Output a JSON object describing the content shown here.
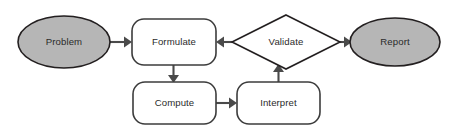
{
  "diagram": {
    "type": "flowchart",
    "background_color": "#ffffff",
    "title": "",
    "nodes": [
      {
        "id": "problem",
        "label": "Problem",
        "shape": "ellipse",
        "fill_color": "#b6b6b6",
        "stroke_color": "#231f20",
        "cx": 64,
        "cy": 42,
        "rx": 46,
        "ry": 26
      },
      {
        "id": "formulate",
        "label": "Formulate",
        "shape": "rounded-rectangle",
        "fill_color": "#ffffff",
        "stroke_color": "#3c3c3c",
        "x": 132,
        "y": 19,
        "width": 84,
        "height": 46,
        "radius": 12
      },
      {
        "id": "validate",
        "label": "Validate",
        "shape": "diamond",
        "fill_color": "#ffffff",
        "stroke_color": "#231f20",
        "cx": 286,
        "cy": 42,
        "rx": 54,
        "ry": 27
      },
      {
        "id": "report",
        "label": "Report",
        "shape": "ellipse",
        "fill_color": "#b6b6b6",
        "stroke_color": "#231f20",
        "cx": 395,
        "cy": 42,
        "rx": 45,
        "ry": 24
      },
      {
        "id": "compute",
        "label": "Compute",
        "shape": "rounded-rectangle",
        "fill_color": "#ffffff",
        "stroke_color": "#3c3c3c",
        "x": 133,
        "y": 82,
        "width": 83,
        "height": 42,
        "radius": 12
      },
      {
        "id": "interpret",
        "label": "Interpret",
        "shape": "rounded-rectangle",
        "fill_color": "#ffffff",
        "stroke_color": "#3c3c3c",
        "x": 237,
        "y": 82,
        "width": 83,
        "height": 42,
        "radius": 12
      }
    ],
    "edges": [
      {
        "id": "problem-to-formulate",
        "from": "problem",
        "to": "formulate",
        "label": "",
        "direction": "right",
        "stroke_color": "#4a4a4a"
      },
      {
        "id": "formulate-to-compute",
        "from": "formulate",
        "to": "compute",
        "label": "",
        "direction": "down",
        "stroke_color": "#4a4a4a"
      },
      {
        "id": "compute-to-interpret",
        "from": "compute",
        "to": "interpret",
        "label": "",
        "direction": "right",
        "stroke_color": "#4a4a4a"
      },
      {
        "id": "interpret-to-validate",
        "from": "interpret",
        "to": "validate",
        "label": "",
        "direction": "up",
        "stroke_color": "#4a4a4a"
      },
      {
        "id": "validate-to-formulate",
        "from": "validate",
        "to": "formulate",
        "label": "",
        "direction": "left",
        "stroke_color": "#4a4a4a"
      },
      {
        "id": "validate-to-report",
        "from": "validate",
        "to": "report",
        "label": "",
        "direction": "right",
        "stroke_color": "#4a4a4a"
      }
    ]
  }
}
